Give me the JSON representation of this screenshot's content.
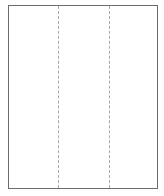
{
  "diagram": {
    "type": "trifold-page-layout",
    "panel_count": 3,
    "fold_count": 2,
    "colors": {
      "border": "#6b6b6b",
      "fold_line": "#a8a8a8",
      "background": "#ffffff"
    },
    "panels": [
      {
        "id": "left-panel"
      },
      {
        "id": "center-panel"
      },
      {
        "id": "right-panel"
      }
    ],
    "folds": [
      {
        "id": "fold-1",
        "style": "dashed"
      },
      {
        "id": "fold-2",
        "style": "dashed"
      }
    ]
  }
}
